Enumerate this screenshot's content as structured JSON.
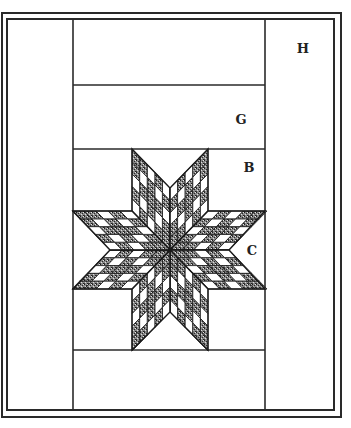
{
  "figure": {
    "labels": [
      {
        "id": "H",
        "text": "H",
        "x": 303,
        "y": 53
      },
      {
        "id": "G",
        "text": "G",
        "x": 241,
        "y": 124
      },
      {
        "id": "B",
        "text": "B",
        "x": 249,
        "y": 172
      },
      {
        "id": "C",
        "text": "C",
        "x": 252,
        "y": 255
      }
    ],
    "frame": {
      "outer": {
        "x": 2,
        "y": 13,
        "w": 339,
        "h": 404
      },
      "inner": {
        "x": 7,
        "y": 19,
        "w": 327,
        "h": 391
      }
    },
    "center_column": {
      "x_left": 73,
      "x_right": 265
    },
    "horizontal_lines_y": [
      85,
      149,
      350
    ],
    "star": {
      "center": [
        170,
        250
      ],
      "grid_divisions": 5,
      "colors": {
        "dark": "#6e6e6e",
        "light": "#ffffff",
        "outline": "#1a1a1a"
      }
    }
  }
}
